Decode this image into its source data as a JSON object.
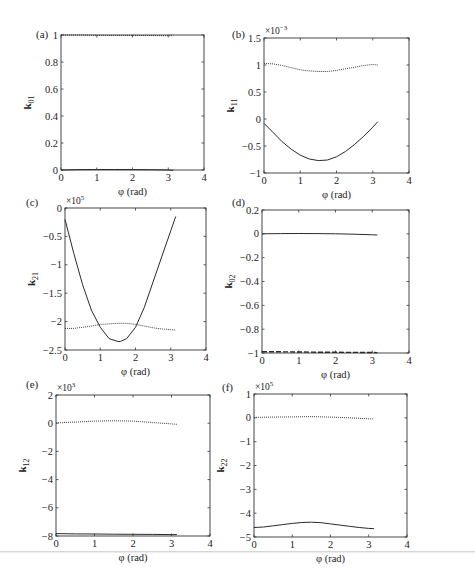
{
  "figure": {
    "panels": [
      {
        "id": "a",
        "label": "(a)",
        "ylabel": "k",
        "ylabel_sub": "01",
        "xlabel": "φ (rad)",
        "multiplier": ""
      },
      {
        "id": "b",
        "label": "(b)",
        "ylabel": "k",
        "ylabel_sub": "11",
        "xlabel": "φ (rad)",
        "multiplier": "×10",
        "multiplier_exp": "−3"
      },
      {
        "id": "c",
        "label": "(c)",
        "ylabel": "k",
        "ylabel_sub": "21",
        "xlabel": "φ (rad)",
        "multiplier": "×10",
        "multiplier_exp": "5"
      },
      {
        "id": "d",
        "label": "(d)",
        "ylabel": "k",
        "ylabel_sub": "02",
        "xlabel": "φ (rad)",
        "multiplier": ""
      },
      {
        "id": "e",
        "label": "(e)",
        "ylabel": "k",
        "ylabel_sub": "12",
        "xlabel": "φ (rad)",
        "multiplier": "×10",
        "multiplier_exp": "3"
      },
      {
        "id": "f",
        "label": "(f)",
        "ylabel": "k",
        "ylabel_sub": "22",
        "xlabel": "φ (rad)",
        "multiplier": "×10",
        "multiplier_exp": "5"
      }
    ]
  },
  "chart_data": [
    {
      "type": "line",
      "panel": "(a)",
      "title": "",
      "xlabel": "φ (rad)",
      "ylabel": "k01",
      "xlim": [
        0,
        4
      ],
      "ylim": [
        0,
        1
      ],
      "xticks": [
        0,
        1,
        2,
        3,
        4
      ],
      "yticks": [
        0,
        0.2,
        0.4,
        0.6,
        0.8,
        1
      ],
      "ytick_labels": [
        "0",
        "0.2",
        "0.4",
        "0.6",
        "0.8",
        "1"
      ],
      "grid": false,
      "box": [
        61,
        35,
        204,
        170
      ],
      "series": [
        {
          "name": "dotted",
          "style": "dotted",
          "x": [
            0,
            0.5,
            1,
            1.5,
            2,
            2.5,
            3,
            3.14
          ],
          "y": [
            1.0,
            1.0,
            0.998,
            0.997,
            0.997,
            0.996,
            0.995,
            0.995
          ]
        },
        {
          "name": "solid",
          "style": "solid",
          "x": [
            0,
            0.5,
            1,
            1.5,
            2,
            2.5,
            3,
            3.14
          ],
          "y": [
            0.0,
            0.003,
            0.004,
            0.004,
            0.003,
            0.002,
            0.0,
            -0.002
          ]
        }
      ]
    },
    {
      "type": "line",
      "panel": "(b)",
      "title": "",
      "xlabel": "φ (rad)",
      "ylabel": "k11",
      "scale": "×10^-3",
      "xlim": [
        0,
        4
      ],
      "ylim": [
        -1,
        1.5
      ],
      "xticks": [
        0,
        1,
        2,
        3,
        4
      ],
      "yticks": [
        -1,
        -0.5,
        0,
        0.5,
        1,
        1.5
      ],
      "ytick_labels": [
        "−1",
        "−0.5",
        "0",
        "0.5",
        "1",
        "1.5"
      ],
      "grid": false,
      "box": [
        264,
        38,
        409,
        173
      ],
      "series": [
        {
          "name": "dotted",
          "style": "dotted",
          "x": [
            0,
            0.25,
            0.5,
            0.75,
            1,
            1.25,
            1.5,
            1.75,
            2,
            2.25,
            2.5,
            2.75,
            3,
            3.14
          ],
          "y": [
            1.03,
            1.02,
            0.99,
            0.95,
            0.91,
            0.89,
            0.88,
            0.88,
            0.9,
            0.93,
            0.96,
            0.99,
            1.01,
            1.0
          ]
        },
        {
          "name": "solid",
          "style": "solid",
          "x": [
            0,
            0.25,
            0.5,
            0.75,
            1,
            1.25,
            1.5,
            1.75,
            2,
            2.25,
            2.5,
            2.75,
            3,
            3.14
          ],
          "y": [
            -0.08,
            -0.25,
            -0.42,
            -0.56,
            -0.67,
            -0.74,
            -0.77,
            -0.76,
            -0.7,
            -0.6,
            -0.47,
            -0.32,
            -0.15,
            -0.05
          ]
        }
      ]
    },
    {
      "type": "line",
      "panel": "(c)",
      "title": "",
      "xlabel": "φ (rad)",
      "ylabel": "k21",
      "scale": "×10^5",
      "xlim": [
        0,
        4
      ],
      "ylim": [
        -2.5,
        0
      ],
      "xticks": [
        0,
        1,
        2,
        3,
        4
      ],
      "yticks": [
        -2.5,
        -2,
        -1.5,
        -1,
        -0.5,
        0
      ],
      "ytick_labels": [
        "−2.5",
        "−2",
        "−1.5",
        "−1",
        "−0.5",
        "0"
      ],
      "grid": false,
      "box": [
        65,
        208,
        206,
        350
      ],
      "series": [
        {
          "name": "solid",
          "style": "solid",
          "x": [
            0,
            0.25,
            0.5,
            0.75,
            1,
            1.25,
            1.5,
            1.57,
            1.75,
            2,
            2.25,
            2.5,
            2.75,
            3,
            3.14
          ],
          "y": [
            -0.2,
            -0.8,
            -1.35,
            -1.8,
            -2.1,
            -2.3,
            -2.35,
            -2.35,
            -2.3,
            -2.1,
            -1.75,
            -1.3,
            -0.85,
            -0.4,
            -0.15
          ]
        },
        {
          "name": "dotted",
          "style": "dotted",
          "x": [
            0,
            0.25,
            0.5,
            0.75,
            1,
            1.25,
            1.5,
            1.75,
            2,
            2.25,
            2.5,
            2.75,
            3,
            3.14
          ],
          "y": [
            -2.12,
            -2.12,
            -2.1,
            -2.08,
            -2.05,
            -2.04,
            -2.03,
            -2.03,
            -2.05,
            -2.08,
            -2.11,
            -2.13,
            -2.14,
            -2.15
          ]
        }
      ]
    },
    {
      "type": "line",
      "panel": "(d)",
      "title": "",
      "xlabel": "φ (rad)",
      "ylabel": "k02",
      "xlim": [
        0,
        4
      ],
      "ylim": [
        -1,
        0.2
      ],
      "xticks": [
        0,
        1,
        2,
        3,
        4
      ],
      "yticks": [
        -1,
        -0.8,
        -0.6,
        -0.4,
        -0.2,
        0,
        0.2
      ],
      "ytick_labels": [
        "−1",
        "−0.8",
        "−0.6",
        "−0.4",
        "−0.2",
        "0",
        "0.2"
      ],
      "grid": false,
      "box": [
        262,
        210,
        409,
        353
      ],
      "series": [
        {
          "name": "solid",
          "style": "solid",
          "x": [
            0,
            0.5,
            1,
            1.5,
            2,
            2.5,
            3,
            3.14
          ],
          "y": [
            0.0,
            0.002,
            0.003,
            0.002,
            0.0,
            -0.003,
            -0.008,
            -0.01
          ]
        },
        {
          "name": "dashed",
          "style": "dashed",
          "x": [
            0,
            0.5,
            1,
            1.5,
            2,
            2.5,
            3,
            3.14
          ],
          "y": [
            -0.99,
            -0.99,
            -0.992,
            -0.993,
            -0.994,
            -0.995,
            -0.996,
            -0.997
          ]
        }
      ]
    },
    {
      "type": "line",
      "panel": "(e)",
      "title": "",
      "xlabel": "φ (rad)",
      "ylabel": "k12",
      "scale": "×10^3",
      "xlim": [
        0,
        4
      ],
      "ylim": [
        -8,
        2
      ],
      "xticks": [
        0,
        1,
        2,
        3,
        4
      ],
      "yticks": [
        -8,
        -6,
        -4,
        -2,
        0,
        2
      ],
      "ytick_labels": [
        "−8",
        "−6",
        "−4",
        "−2",
        "0",
        "2"
      ],
      "grid": false,
      "box": [
        56,
        395,
        210,
        536
      ],
      "series": [
        {
          "name": "dotted",
          "style": "dotted",
          "x": [
            0,
            0.5,
            1,
            1.5,
            2,
            2.5,
            3,
            3.14
          ],
          "y": [
            0.02,
            0.08,
            0.15,
            0.18,
            0.15,
            0.05,
            -0.05,
            -0.08
          ]
        },
        {
          "name": "solid",
          "style": "solid",
          "x": [
            0,
            0.5,
            1,
            1.5,
            2,
            2.5,
            3,
            3.14
          ],
          "y": [
            -7.83,
            -7.85,
            -7.86,
            -7.87,
            -7.88,
            -7.89,
            -7.9,
            -7.9
          ]
        }
      ]
    },
    {
      "type": "line",
      "panel": "(f)",
      "title": "",
      "xlabel": "φ (rad)",
      "ylabel": "k22",
      "scale": "×10^5",
      "xlim": [
        0,
        4
      ],
      "ylim": [
        -5,
        1
      ],
      "xticks": [
        0,
        1,
        2,
        3,
        4
      ],
      "yticks": [
        -5,
        -4,
        -3,
        -2,
        -1,
        0,
        1
      ],
      "ytick_labels": [
        "−5",
        "−4",
        "−3",
        "−2",
        "−1",
        "0",
        "1"
      ],
      "grid": false,
      "box": [
        254,
        394,
        407,
        537
      ],
      "series": [
        {
          "name": "dotted",
          "style": "dotted",
          "x": [
            0,
            0.5,
            1,
            1.5,
            2,
            2.5,
            3,
            3.14
          ],
          "y": [
            0.02,
            0.03,
            0.04,
            0.05,
            0.03,
            0.0,
            -0.04,
            -0.05
          ]
        },
        {
          "name": "solid",
          "style": "solid",
          "x": [
            0,
            0.25,
            0.5,
            0.75,
            1,
            1.25,
            1.5,
            1.75,
            2,
            2.25,
            2.5,
            2.75,
            3,
            3.14
          ],
          "y": [
            -4.6,
            -4.58,
            -4.53,
            -4.48,
            -4.43,
            -4.39,
            -4.38,
            -4.4,
            -4.45,
            -4.5,
            -4.55,
            -4.6,
            -4.64,
            -4.65
          ]
        }
      ]
    }
  ]
}
